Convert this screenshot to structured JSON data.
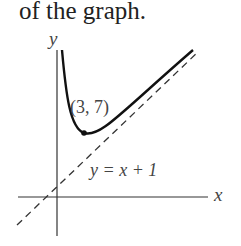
{
  "caption": "of the graph.",
  "axes": {
    "x_label": "x",
    "y_label": "y"
  },
  "point_label": "(3, 7)",
  "asymptote_label": "y = x + 1"
}
